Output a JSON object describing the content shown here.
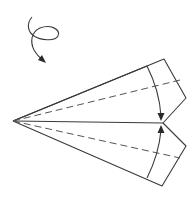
{
  "diagram": {
    "colors": {
      "line": "#3a3a3a",
      "dashed": "#555555",
      "background": "#ffffff"
    },
    "symbols": [
      {
        "name": "turn-over-icon",
        "meaning": "turn model over"
      },
      {
        "name": "fold-arrow-top",
        "meaning": "fold top flap down to center"
      },
      {
        "name": "fold-arrow-bottom",
        "meaning": "fold bottom flap up to center"
      }
    ]
  }
}
